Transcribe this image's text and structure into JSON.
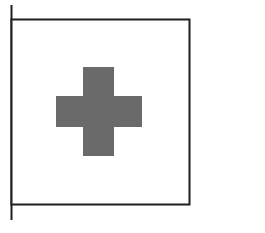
{
  "figure": {
    "colors": {
      "background": "#ffffff",
      "outline": "#1e1e1e",
      "cross": "#6a6a6a"
    }
  }
}
